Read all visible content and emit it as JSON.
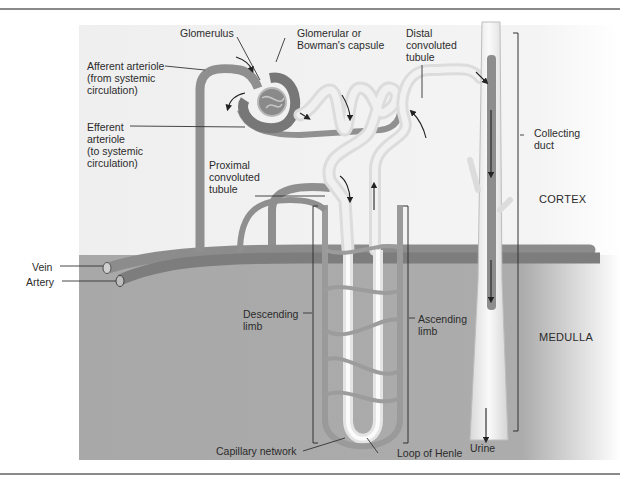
{
  "figure": {
    "regions": {
      "cortex": "CORTEX",
      "medulla": "MEDULLA"
    },
    "labels": {
      "glomerulus": "Glomerulus",
      "capsule": "Glomerular or\nBowman's capsule",
      "distal": "Distal\nconvoluted\ntubule",
      "afferent": "Afferent arteriole\n(from systemic\ncirculation)",
      "efferent": "Efferent\narteriole\n(to systemic\ncirculation)",
      "proximal": "Proximal\nconvoluted\ntubule",
      "collecting": "Collecting\nduct",
      "vein": "Vein",
      "artery": "Artery",
      "descending": "Descending\nlimb",
      "ascending": "Ascending\nlimb",
      "capillary": "Capillary network",
      "loop": "Loop of Henle",
      "urine": "Urine"
    },
    "colors": {
      "cortex_bg": "#f3f3f3",
      "medulla_bg": "#a9a9a9",
      "vessel": "#8e8e8e",
      "tubule": "#e6e6e6",
      "rule": "#8a8a8a"
    }
  }
}
